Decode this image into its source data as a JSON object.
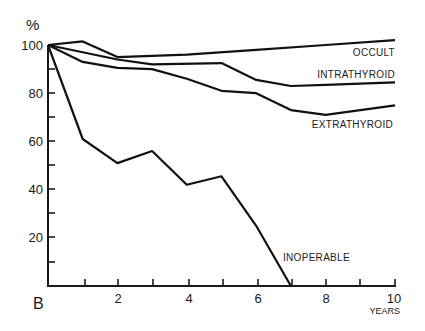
{
  "chart_data": {
    "type": "line",
    "title": "",
    "panel_label": "B",
    "xlabel": "YEARS",
    "ylabel": "%",
    "xlim": [
      0,
      10
    ],
    "ylim": [
      0,
      100
    ],
    "x_ticks": [
      0,
      1,
      2,
      3,
      4,
      5,
      6,
      7,
      8,
      9,
      10
    ],
    "x_tick_labels": [
      "2",
      "4",
      "6",
      "8",
      "10"
    ],
    "y_ticks": [
      10,
      20,
      30,
      40,
      50,
      60,
      70,
      80,
      90,
      100
    ],
    "y_tick_labels": [
      "20",
      "40",
      "60",
      "80",
      "100"
    ],
    "grid": false,
    "legend": "inline labels",
    "series": [
      {
        "name": "OCCULT",
        "x": [
          0,
          1,
          2,
          4,
          6,
          8,
          10
        ],
        "values": [
          100,
          101.5,
          95,
          96,
          98,
          100,
          102
        ]
      },
      {
        "name": "INTRATHYROID",
        "x": [
          0,
          2,
          3,
          5,
          6,
          7,
          8,
          10
        ],
        "values": [
          100,
          94,
          92,
          92.5,
          85.5,
          83,
          83.5,
          84.5
        ]
      },
      {
        "name": "EXTRATHYROID",
        "x": [
          0,
          1,
          2,
          3,
          4,
          5,
          6,
          7,
          8,
          9,
          10
        ],
        "values": [
          100,
          93,
          90.5,
          90,
          86,
          81,
          80,
          73,
          71,
          73,
          75
        ]
      },
      {
        "name": "INOPERABLE",
        "x": [
          0,
          1,
          2,
          3,
          4,
          5,
          6,
          7
        ],
        "values": [
          100,
          61,
          51,
          56,
          42,
          45.5,
          25,
          0
        ]
      }
    ]
  },
  "labels": {
    "y_unit": "%",
    "x_unit": "YEARS",
    "panel": "B",
    "occult": "OCCULT",
    "intrathyroid": "INTRATHYROID",
    "extrathyroid": "EXTRATHYROID",
    "inoperable": "INOPERABLE",
    "y100": "100",
    "y80": "80",
    "y60": "60",
    "y40": "40",
    "y20": "20",
    "x2": "2",
    "x4": "4",
    "x6": "6",
    "x8": "8",
    "x10": "10"
  }
}
